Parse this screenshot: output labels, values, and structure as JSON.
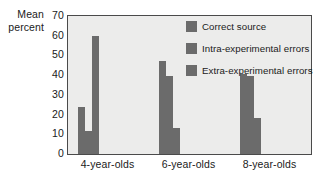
{
  "chart_data": {
    "type": "bar",
    "title": "",
    "xlabel": "",
    "ylabel": "Mean percent",
    "ylabel_lines": [
      "Mean",
      "percent"
    ],
    "categories": [
      "4-year-olds",
      "6-year-olds",
      "8-year-olds"
    ],
    "series": [
      {
        "name": "Correct source",
        "values": [
          24,
          47,
          40.5
        ],
        "color": "#6b6b6b"
      },
      {
        "name": "Intra-experimental errors",
        "values": [
          11.5,
          39.5,
          39.5
        ],
        "color": "#6b6b6b"
      },
      {
        "name": "Extra-experimental errors",
        "values": [
          60,
          13,
          18.5
        ],
        "color": "#6b6b6b"
      }
    ],
    "ylim": [
      0,
      70
    ],
    "yticks": [
      0,
      10,
      20,
      30,
      40,
      50,
      60,
      70
    ],
    "ytick_labels": [
      "0",
      "10",
      "20",
      "30",
      "40",
      "50",
      "60",
      "70"
    ],
    "grid": false,
    "legend_position": "top-right",
    "plot_background": "#ececeb",
    "axis_color": "#4a4a4a"
  }
}
